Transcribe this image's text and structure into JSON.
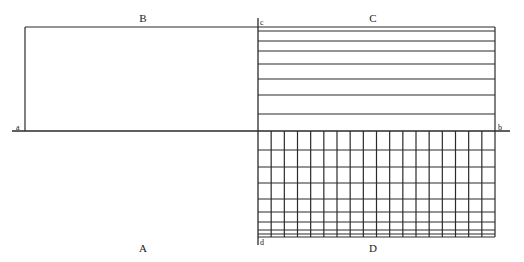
{
  "diagram": {
    "width": 524,
    "height": 262,
    "stroke_color": "#2a2a2a",
    "axis": {
      "y": 131,
      "x1": 12,
      "x2": 510,
      "label_left": "a",
      "label_right": "b"
    },
    "region_B": {
      "label": "B",
      "left": 25,
      "top": 27,
      "right": 258,
      "bottom": 131
    },
    "region_C": {
      "label": "C",
      "corner_label": "c",
      "left": 258,
      "right": 495,
      "horizontal_lines_y": [
        27,
        31,
        41,
        51,
        64,
        79,
        95,
        114
      ]
    },
    "region_D": {
      "label": "D",
      "corner_label": "d",
      "left": 258,
      "right": 495,
      "top": 131,
      "bottom": 237,
      "column_count": 18,
      "horizontal_lines_y": [
        150,
        167,
        183,
        199,
        212,
        222,
        230,
        234,
        237
      ]
    },
    "region_A": {
      "label": "A"
    },
    "divider": {
      "x": 258,
      "y1": 18,
      "y2": 245
    }
  }
}
